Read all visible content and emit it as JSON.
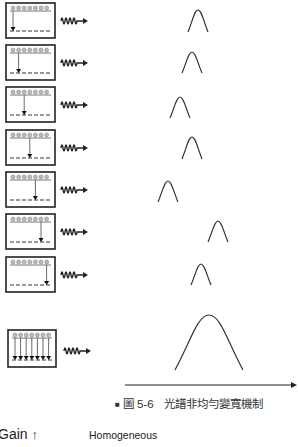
{
  "figure": {
    "caption_marker": "■",
    "caption_label": "圖 5-6",
    "caption_title": "光譜非均勻變寬機制"
  },
  "rows": [
    {
      "transition_pos": 0,
      "peak_x": 198,
      "peak_top": 10,
      "peak_bottom": 32
    },
    {
      "transition_pos": 1,
      "peak_x": 192,
      "peak_top": 52,
      "peak_bottom": 73
    },
    {
      "transition_pos": 2,
      "peak_x": 180,
      "peak_top": 97,
      "peak_bottom": 118
    },
    {
      "transition_pos": 3,
      "peak_x": 192,
      "peak_top": 137,
      "peak_bottom": 159
    },
    {
      "transition_pos": 4,
      "peak_x": 168,
      "peak_top": 181,
      "peak_bottom": 202
    },
    {
      "transition_pos": 5,
      "peak_x": 218,
      "peak_top": 221,
      "peak_bottom": 242
    },
    {
      "transition_pos": 6,
      "peak_x": 201,
      "peak_top": 264,
      "peak_bottom": 285
    }
  ],
  "combined": {
    "peak_x": 209,
    "peak_top": 315,
    "peak_bottom": 370
  },
  "axis": {
    "x_label": ""
  },
  "next_figure": {
    "y_axis_label": "Gain",
    "title": "Homogeneous"
  }
}
